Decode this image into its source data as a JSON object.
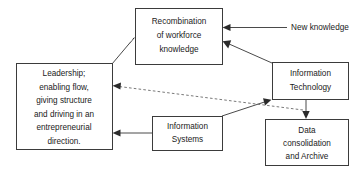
{
  "diagram": {
    "background_color": "#ffffff",
    "box_border_color": "#3b3b3b",
    "edge_color": "#4a4a4a",
    "dashed_edge_color": "#6a6a6a",
    "nodes": [
      {
        "id": "recombination",
        "label": "Recombination of workforce knowledge",
        "lines": [
          "Recombination",
          "of workforce",
          "knowledge"
        ],
        "boxed": true
      },
      {
        "id": "leadership",
        "label": "Leadership; enabling flow, giving structure and driving in an entrepreneurial direction.",
        "lines": [
          "Leadership;",
          "enabling flow,",
          "giving structure",
          "and driving in an",
          "entrepreneurial",
          "direction."
        ],
        "boxed": true
      },
      {
        "id": "information-technology",
        "label": "Information Technology",
        "lines": [
          "Information",
          "Technology"
        ],
        "boxed": true
      },
      {
        "id": "information-systems",
        "label": "Information Systems",
        "lines": [
          "Information",
          "Systems"
        ],
        "boxed": true
      },
      {
        "id": "data-consolidation",
        "label": "Data consolidation and Archive",
        "lines": [
          "Data",
          "consolidation",
          "and Archive"
        ],
        "boxed": true
      },
      {
        "id": "new-knowledge",
        "label": "New knowledge",
        "lines": [
          "New knowledge"
        ],
        "boxed": false
      }
    ],
    "edges": [
      {
        "id": "new-knowledge-to-recombination",
        "from": "new-knowledge",
        "to": "recombination",
        "style": "solid",
        "arrow": "end"
      },
      {
        "id": "leadership-to-recombination",
        "from": "leadership",
        "to": "recombination",
        "style": "solid",
        "arrow": "end"
      },
      {
        "id": "information-technology-to-recombination",
        "from": "information-technology",
        "to": "recombination",
        "style": "solid",
        "arrow": "end"
      },
      {
        "id": "information-technology-to-data-consolidation",
        "from": "information-technology",
        "to": "data-consolidation",
        "style": "solid",
        "arrow": "end"
      },
      {
        "id": "information-systems-to-information-technology",
        "from": "information-systems",
        "to": "information-technology",
        "style": "solid",
        "arrow": "end"
      },
      {
        "id": "information-systems-to-leadership",
        "from": "information-systems",
        "to": "leadership",
        "style": "solid",
        "arrow": "end"
      },
      {
        "id": "data-consolidation-to-leadership",
        "from": "data-consolidation",
        "to": "leadership",
        "style": "dashed",
        "arrow": "end"
      }
    ]
  }
}
